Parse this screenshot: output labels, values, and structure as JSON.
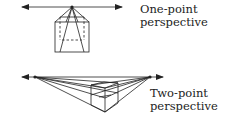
{
  "diagrams": [
    {
      "id": "one-point",
      "label_line1": "One-point",
      "label_line2": "perspective",
      "horizon": {
        "x1": 22,
        "x2": 122,
        "y": 7
      },
      "vanishing_points": [
        {
          "x": 72,
          "y": 7
        }
      ]
    },
    {
      "id": "two-point",
      "label_line1": "Two-point",
      "label_line2": "perspective",
      "horizon": {
        "x1": 22,
        "x2": 163,
        "y": 77
      },
      "vanishing_points": [
        {
          "x": 35,
          "y": 77
        },
        {
          "x": 150,
          "y": 77
        }
      ]
    }
  ],
  "colors": {
    "line": "#222222",
    "background": "#ffffff"
  }
}
